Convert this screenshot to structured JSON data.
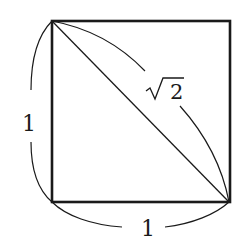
{
  "diagram": {
    "title": "",
    "shape": "square",
    "colors": {
      "stroke": "#1a1a1a",
      "background": "#ffffff"
    },
    "labels": {
      "left_side": "1",
      "bottom_side": "1",
      "diagonal_radicand": "2",
      "diagonal_symbol": "√"
    }
  }
}
